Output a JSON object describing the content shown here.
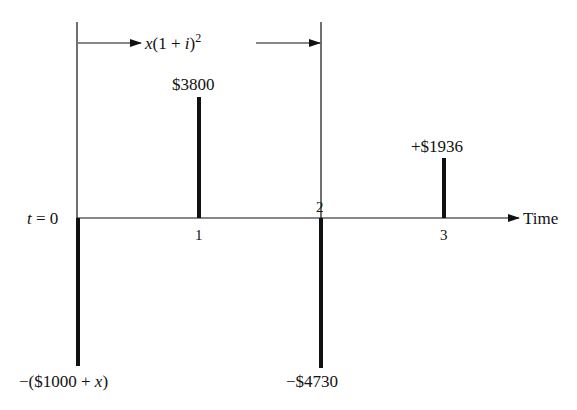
{
  "diagram": {
    "type": "cash-flow-timeline",
    "colors": {
      "line": "#111111",
      "background": "#ffffff"
    },
    "bracket": {
      "label_var": "x",
      "label_rest": "(1 + ",
      "label_i": "i",
      "label_close": ")",
      "label_exp": "2",
      "from_time": 0,
      "to_time": 2
    },
    "axis": {
      "origin_label_var": "t",
      "origin_label_rest": " = 0",
      "end_label": "Time",
      "ticks": [
        "1",
        "2",
        "3"
      ]
    },
    "flows": [
      {
        "time": 0,
        "direction": "down",
        "label": "−($1000 + x)",
        "label_pre": "−($1000 + ",
        "label_var": "x",
        "label_post": ")"
      },
      {
        "time": 1,
        "direction": "up",
        "label": "$3800"
      },
      {
        "time": 2,
        "direction": "down",
        "label": "−$4730"
      },
      {
        "time": 3,
        "direction": "up",
        "label": "+$1936"
      }
    ]
  }
}
